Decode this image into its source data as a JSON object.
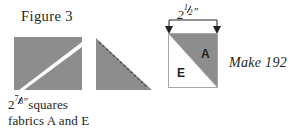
{
  "figure": {
    "title": "Figure 3"
  },
  "caption": {
    "line1_prefix": "2",
    "line1_fraction_numerator": "7",
    "line1_fraction_denominator": "8",
    "line1_inch_mark": "”",
    "line1_suffix": "squares",
    "line2": "fabrics A and E"
  },
  "dimension": {
    "label_value": "2",
    "label_fraction_numerator": "1",
    "label_fraction_denominator": "2",
    "label_inch_mark": "”"
  },
  "instruction": {
    "make_label": "Make 192"
  },
  "block": {
    "patch_a_label": "A",
    "patch_e_label": "E"
  },
  "steps": [
    {
      "name": "step-1-marked-square",
      "description": "Gray square with white diagonal stripe from top-left to bottom-right"
    },
    {
      "name": "step-2-stitched-triangle",
      "description": "Gray triangle with dashed stitching line along hypotenuse"
    },
    {
      "name": "step-3-finished-unit",
      "description": "Half-square triangle unit, gray A upper-right, white E lower-left"
    }
  ],
  "colors": {
    "fabric_gray": "#8d8d8d",
    "fabric_white": "#ffffff",
    "outline": "#a7a7a7",
    "ink": "#231f20",
    "background": "#ffffff"
  }
}
